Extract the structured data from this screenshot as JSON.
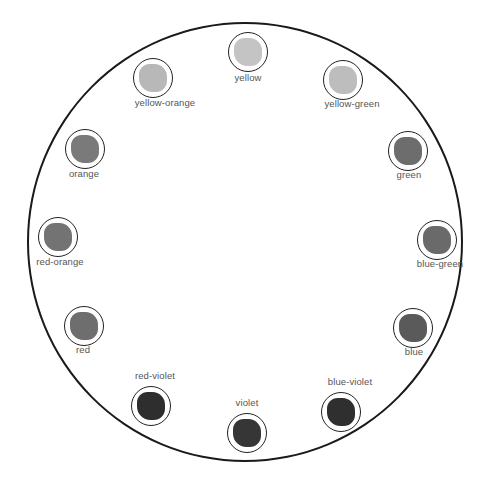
{
  "diagram": {
    "type": "color-wheel",
    "swatches": [
      {
        "id": "yellow",
        "label": "yellow",
        "cx": 248,
        "cy": 52,
        "fill": "#c4c4c4",
        "lx": 248,
        "ly": 78
      },
      {
        "id": "yellow-green",
        "label": "yellow-green",
        "cx": 343,
        "cy": 80,
        "fill": "#bdbdbd",
        "lx": 352,
        "ly": 104
      },
      {
        "id": "green",
        "label": "green",
        "cx": 408,
        "cy": 151,
        "fill": "#6d6d6d",
        "lx": 409,
        "ly": 175
      },
      {
        "id": "blue-green",
        "label": "blue-green",
        "cx": 437,
        "cy": 240,
        "fill": "#6a6a6a",
        "lx": 440,
        "ly": 264
      },
      {
        "id": "blue",
        "label": "blue",
        "cx": 413,
        "cy": 328,
        "fill": "#5a5a5a",
        "lx": 414,
        "ly": 352
      },
      {
        "id": "blue-violet",
        "label": "blue-violet",
        "cx": 341,
        "cy": 412,
        "fill": "#2f2f2f",
        "lx": 350,
        "ly": 382
      },
      {
        "id": "violet",
        "label": "violet",
        "cx": 247,
        "cy": 433,
        "fill": "#363636",
        "lx": 247,
        "ly": 403
      },
      {
        "id": "red-violet",
        "label": "red-violet",
        "cx": 151,
        "cy": 406,
        "fill": "#2e2e2e",
        "lx": 155,
        "ly": 376
      },
      {
        "id": "red",
        "label": "red",
        "cx": 84,
        "cy": 326,
        "fill": "#6e6e6e",
        "lx": 83,
        "ly": 350
      },
      {
        "id": "red-orange",
        "label": "red-orange",
        "cx": 58,
        "cy": 237,
        "fill": "#737373",
        "lx": 60,
        "ly": 262
      },
      {
        "id": "orange",
        "label": "orange",
        "cx": 85,
        "cy": 149,
        "fill": "#7a7a7a",
        "lx": 84,
        "ly": 174
      },
      {
        "id": "yellow-orange",
        "label": "yellow-orange",
        "cx": 153,
        "cy": 78,
        "fill": "#b8b8b8",
        "lx": 165,
        "ly": 103
      }
    ]
  }
}
